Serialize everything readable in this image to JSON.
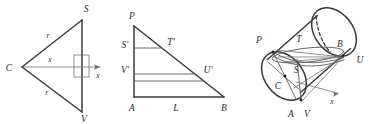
{
  "figure": {
    "panels": [
      {
        "id": "panel-left",
        "name": "cross-section-triangle",
        "labels": {
          "apex_left": "C",
          "top_vertex": "S",
          "bottom_vertex": "V",
          "radius_upper": "r",
          "radius_lower": "r",
          "axis_var": "x",
          "axis_arrow_label": "x"
        },
        "has_right_angle_marker": true
      },
      {
        "id": "panel-middle",
        "name": "unrolled-right-triangle",
        "labels": {
          "top_vertex": "P",
          "left_upper": "S'",
          "hyp_upper": "T'",
          "left_lower": "V'",
          "hyp_lower": "U'",
          "bottom_left": "A",
          "bottom_mid": "L",
          "bottom_right": "B"
        }
      },
      {
        "id": "panel-right",
        "name": "cylinder-3d",
        "labels": {
          "p": "P",
          "t": "T",
          "b": "B",
          "u": "U",
          "s": "S",
          "c": "C",
          "a": "A",
          "v": "V",
          "axis_arrow_label": "x"
        }
      }
    ],
    "colors": {
      "ink": "#3a3a3a",
      "ink_light": "#6a6a6a",
      "label": "#2a2a2a",
      "background": "#ffffff"
    }
  }
}
